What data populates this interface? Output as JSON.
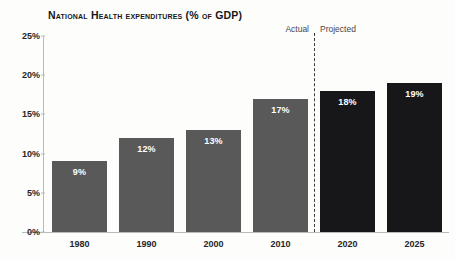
{
  "chart_data": {
    "type": "bar",
    "title": "National Health expenditures (% of GDP)",
    "xlabel": "",
    "ylabel": "",
    "categories": [
      "1980",
      "1990",
      "2000",
      "2010",
      "2020",
      "2025"
    ],
    "values": [
      9,
      12,
      13,
      17,
      18,
      19
    ],
    "data_labels": [
      "9%",
      "12%",
      "13%",
      "17%",
      "18%",
      "19%"
    ],
    "series": [
      {
        "name": "National health expenditures",
        "values": [
          9,
          12,
          13,
          17,
          18,
          19
        ]
      }
    ],
    "ylim": [
      0,
      25
    ],
    "ytick_values": [
      0,
      5,
      10,
      15,
      20,
      25
    ],
    "ytick_labels": [
      "0%",
      "5%",
      "10%",
      "15%",
      "20%",
      "25%"
    ],
    "grid": false,
    "legend": "none",
    "segments": [
      {
        "name": "Actual",
        "categories": [
          "1980",
          "1990",
          "2000",
          "2010"
        ],
        "color": "#59595a"
      },
      {
        "name": "Projected",
        "categories": [
          "2020",
          "2025"
        ],
        "color": "#17171a"
      }
    ],
    "annotations": [
      {
        "name": "actual-label",
        "text": "Actual"
      },
      {
        "name": "projected-label",
        "text": "Projected"
      },
      {
        "name": "phase-divider",
        "text": "",
        "style": "dashed-vertical-line",
        "between": [
          "2010",
          "2020"
        ]
      }
    ],
    "colors": {
      "actual_bar": "#59595a",
      "projected_bar": "#17171a",
      "axis": "#b9b9b6",
      "text": "#26262a",
      "value_label": "#ffffff",
      "background": "#fdfdfc"
    }
  }
}
